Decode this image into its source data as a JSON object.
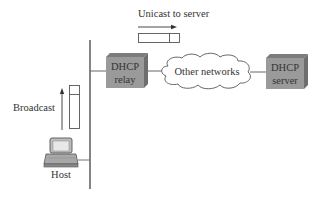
{
  "diagram": {
    "labels": {
      "unicast": "Unicast to server",
      "broadcast": "Broadcast",
      "host": "Host",
      "relay_line1": "DHCP",
      "relay_line2": "relay",
      "cloud": "Other networks",
      "server_line1": "DHCP",
      "server_line2": "server"
    },
    "colors": {
      "box_front": "#9a9a9a",
      "box_top": "#7c7c7c",
      "box_side": "#6e6e6e",
      "line": "#555555",
      "text": "#333333"
    }
  }
}
